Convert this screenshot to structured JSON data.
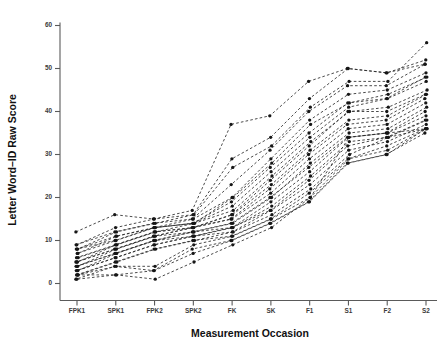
{
  "chart": {
    "title": "",
    "xlabel": "Measurement Occasion",
    "ylabel": "Letter Word–ID Raw Score"
  },
  "colors": {
    "line": "#2b2b2b",
    "marker": "#161616",
    "axis": "#5a5a5a",
    "tick_text": "#3a3a3a",
    "title_text": "#111111",
    "background": "#ffffff"
  },
  "chart_data": {
    "type": "line",
    "title": "",
    "xlabel": "Measurement Occasion",
    "ylabel": "Letter Word–ID Raw Score",
    "categories": [
      "FPK1",
      "SPK1",
      "FPK2",
      "SPK2",
      "FK",
      "SK",
      "F1",
      "S1",
      "F2",
      "S2"
    ],
    "yticks": [
      0,
      10,
      20,
      30,
      40,
      50,
      60
    ],
    "ylim": [
      -1,
      62
    ],
    "grid": false,
    "legend": "none",
    "line_style": "dashed",
    "marker_style": "filled-circle",
    "series": [
      {
        "name": "S01",
        "values": [
          12,
          16,
          15,
          17,
          37,
          39,
          47,
          50,
          49,
          51
        ]
      },
      {
        "name": "S02",
        "values": [
          9,
          13,
          15,
          16,
          29,
          34,
          43,
          50,
          49,
          52
        ]
      },
      {
        "name": "S03",
        "values": [
          8,
          12,
          14,
          16,
          27,
          32,
          41,
          47,
          47,
          56
        ]
      },
      {
        "name": "S04",
        "values": [
          9,
          12,
          14,
          15,
          23,
          31,
          40,
          46,
          46,
          51
        ]
      },
      {
        "name": "S05",
        "values": [
          8,
          11,
          13,
          15,
          20,
          29,
          38,
          44,
          45,
          49
        ]
      },
      {
        "name": "S06",
        "values": [
          7,
          11,
          13,
          14,
          20,
          28,
          37,
          42,
          44,
          48
        ]
      },
      {
        "name": "S07",
        "values": [
          8,
          10,
          13,
          14,
          19,
          27,
          35,
          42,
          43,
          48
        ]
      },
      {
        "name": "S08",
        "values": [
          7,
          10,
          13,
          14,
          18,
          26,
          34,
          41,
          43,
          47
        ]
      },
      {
        "name": "S09",
        "values": [
          6,
          9,
          12,
          14,
          17,
          25,
          33,
          40,
          41,
          45
        ]
      },
      {
        "name": "S10",
        "values": [
          6,
          9,
          12,
          13,
          16,
          24,
          32,
          40,
          40,
          44
        ]
      },
      {
        "name": "S11",
        "values": [
          5,
          9,
          12,
          13,
          16,
          23,
          31,
          38,
          39,
          44
        ]
      },
      {
        "name": "S12",
        "values": [
          5,
          8,
          11,
          13,
          15,
          22,
          30,
          37,
          38,
          43
        ]
      },
      {
        "name": "S13",
        "values": [
          5,
          8,
          11,
          13,
          15,
          21,
          29,
          36,
          37,
          42
        ]
      },
      {
        "name": "S14",
        "values": [
          4,
          8,
          11,
          12,
          14,
          20,
          28,
          35,
          36,
          41
        ]
      },
      {
        "name": "S15",
        "values": [
          4,
          7,
          10,
          12,
          14,
          20,
          27,
          34,
          35,
          40
        ]
      },
      {
        "name": "S16",
        "values": [
          4,
          7,
          10,
          12,
          13,
          19,
          26,
          34,
          35,
          39
        ]
      },
      {
        "name": "S17",
        "values": [
          3,
          7,
          10,
          11,
          13,
          18,
          25,
          33,
          34,
          38
        ]
      },
      {
        "name": "S18",
        "values": [
          3,
          6,
          9,
          11,
          13,
          17,
          24,
          32,
          34,
          38
        ]
      },
      {
        "name": "S19",
        "values": [
          3,
          6,
          9,
          11,
          12,
          17,
          23,
          31,
          33,
          37
        ]
      },
      {
        "name": "S20",
        "values": [
          2,
          5,
          8,
          10,
          12,
          16,
          22,
          30,
          34,
          36
        ]
      },
      {
        "name": "S21",
        "values": [
          2,
          5,
          8,
          10,
          11,
          15,
          21,
          29,
          32,
          36
        ]
      },
      {
        "name": "S22",
        "values": [
          2,
          4,
          4,
          9,
          11,
          15,
          20,
          29,
          31,
          36
        ]
      },
      {
        "name": "S23",
        "values": [
          1,
          4,
          3,
          8,
          10,
          14,
          19,
          28,
          30,
          35
        ]
      },
      {
        "name": "S24",
        "values": [
          1,
          2,
          3,
          7,
          10,
          14,
          19,
          28,
          30,
          36
        ]
      },
      {
        "name": "S25",
        "values": [
          2,
          2,
          1,
          5,
          9,
          13,
          20,
          34,
          35,
          36
        ]
      }
    ]
  }
}
